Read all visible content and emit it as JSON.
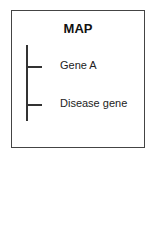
{
  "diagram": {
    "title": "MAP",
    "markers": [
      {
        "label": "Gene A"
      },
      {
        "label": "Disease gene"
      }
    ]
  }
}
